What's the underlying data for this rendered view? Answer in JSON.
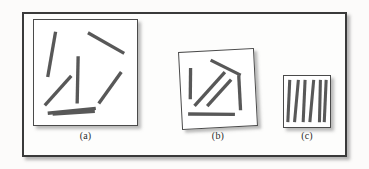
{
  "figure": {
    "background_color": "#fcfbfa",
    "frame_color": "#3a3a3a",
    "panel_fill": "#ffffff",
    "segment_color": "#585858",
    "segment_edge_color": "#3f3f3f"
  },
  "panels": [
    {
      "id": "a",
      "label": "(a)",
      "caption_text": "(a)",
      "frame": {
        "x": 33,
        "y": 19,
        "width": 105,
        "height": 107
      },
      "frame_rotation_deg": 0,
      "segment_count": 7,
      "orientation_regime": "random",
      "segments": [
        {
          "x1": 22,
          "y1": 12,
          "x2": 14,
          "y2": 58
        },
        {
          "x1": 45,
          "y1": 37,
          "x2": 44,
          "y2": 85
        },
        {
          "x1": 55,
          "y1": 13,
          "x2": 92,
          "y2": 34
        },
        {
          "x1": 11,
          "y1": 87,
          "x2": 38,
          "y2": 57
        },
        {
          "x1": 89,
          "y1": 53,
          "x2": 66,
          "y2": 85
        },
        {
          "x1": 14,
          "y1": 95,
          "x2": 63,
          "y2": 90
        },
        {
          "x1": 19,
          "y1": 96,
          "x2": 62,
          "y2": 93
        }
      ]
    },
    {
      "id": "b",
      "label": "(b)",
      "caption_text": "(b)",
      "frame": {
        "x": 180,
        "y": 50,
        "width": 76,
        "height": 78
      },
      "frame_rotation_deg": -3,
      "segment_count": 6,
      "orientation_regime": "intermediate",
      "segments": [
        {
          "x1": 11,
          "y1": 16,
          "x2": 9,
          "y2": 48
        },
        {
          "x1": 32,
          "y1": 9,
          "x2": 62,
          "y2": 26
        },
        {
          "x1": 60,
          "y1": 26,
          "x2": 60,
          "y2": 62
        },
        {
          "x1": 13,
          "y1": 55,
          "x2": 46,
          "y2": 22
        },
        {
          "x1": 26,
          "y1": 56,
          "x2": 52,
          "y2": 30
        },
        {
          "x1": 6,
          "y1": 63,
          "x2": 54,
          "y2": 66
        }
      ]
    },
    {
      "id": "c",
      "label": "(c)",
      "caption_text": "(c)",
      "frame": {
        "x": 283,
        "y": 75,
        "width": 48,
        "height": 53
      },
      "frame_rotation_deg": 0,
      "segment_count": 6,
      "orientation_regime": "nearly-parallel",
      "segments": [
        {
          "x1": 6,
          "y1": 4,
          "x2": 4,
          "y2": 48
        },
        {
          "x1": 15,
          "y1": 4,
          "x2": 11,
          "y2": 48
        },
        {
          "x1": 22,
          "y1": 4,
          "x2": 20,
          "y2": 48
        },
        {
          "x1": 31,
          "y1": 4,
          "x2": 27,
          "y2": 48
        },
        {
          "x1": 38,
          "y1": 4,
          "x2": 37,
          "y2": 48
        },
        {
          "x1": 44,
          "y1": 4,
          "x2": 42,
          "y2": 48
        }
      ]
    }
  ]
}
